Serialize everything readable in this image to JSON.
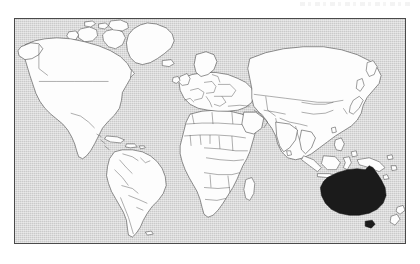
{
  "page": {
    "background_color": "#ffffff",
    "width": 420,
    "height": 264,
    "artifact_note": ""
  },
  "map": {
    "title": "",
    "frame": {
      "border_color": "#4a4a4a",
      "x": 14,
      "y": 18,
      "width": 392,
      "height": 226
    },
    "ocean_color": "#cacaca",
    "land_color": "#fdfdfd",
    "border_color": "#3a3a3a",
    "highlight_color": "#1b1b1b",
    "projection": "equirectangular",
    "highlighted_regions": [
      "Australia",
      "Tasmania"
    ],
    "visible_continents": [
      "North America",
      "South America",
      "Europe",
      "Africa",
      "Asia",
      "Australia",
      "Greenland"
    ],
    "labels": [],
    "legend": []
  }
}
